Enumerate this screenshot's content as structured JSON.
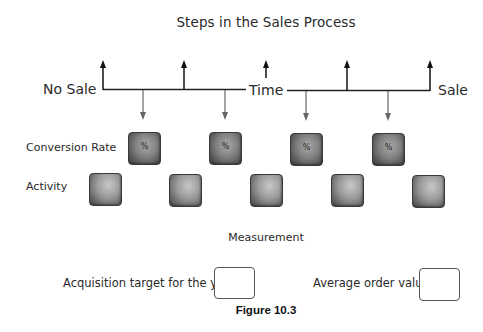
{
  "diagram": {
    "title": "Steps in the Sales Process",
    "timeline": {
      "left_label": "No Sale",
      "center_label": "Time",
      "right_label": "Sale",
      "up_arrows_x": [
        103,
        184,
        266,
        347,
        430
      ],
      "down_arrows_x": [
        143,
        225,
        306,
        388
      ]
    },
    "rows": [
      {
        "label": "Conversion Rate",
        "box_symbol": "%",
        "box_count": 4
      },
      {
        "label": "Activity",
        "box_count": 5
      }
    ],
    "conversion_boxes": [
      {
        "symbol": "%"
      },
      {
        "symbol": "%"
      },
      {
        "symbol": "%"
      },
      {
        "symbol": "%"
      }
    ],
    "measurement": {
      "heading": "Measurement",
      "fields": [
        {
          "label": "Acquisition target for the year",
          "value": ""
        },
        {
          "label": "Average order value",
          "value": ""
        }
      ]
    },
    "caption": "Figure 10.3",
    "colors": {
      "up_arrow": "#111111",
      "down_arrow": "#666666",
      "box_dark": "#444444",
      "box_light": "#c8c8c8"
    }
  }
}
